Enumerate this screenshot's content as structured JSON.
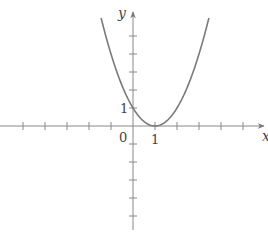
{
  "chart_data": {
    "type": "line",
    "title": "",
    "function": "y = (x - 1)^2",
    "xlabel": "x",
    "ylabel": "y",
    "origin_label": "0",
    "x_tick_labels": [
      {
        "value": 1,
        "label": "1"
      }
    ],
    "y_tick_labels": [
      {
        "value": 1,
        "label": "1"
      }
    ],
    "x_ticks": [
      -5,
      -4,
      -3,
      -2,
      -1,
      1,
      2,
      3,
      4,
      5
    ],
    "y_ticks": [
      -6,
      -5,
      -4,
      -3,
      -2,
      -1,
      1,
      2,
      3,
      4,
      5
    ],
    "xlim": [
      -6,
      6
    ],
    "ylim": [
      -6,
      6
    ],
    "grid": false,
    "legend": null,
    "series": [
      {
        "name": "parabola",
        "x": [
          -1.45,
          -1,
          -0.5,
          0,
          0.5,
          1,
          1.5,
          2,
          2.5,
          3,
          3.45
        ],
        "y": [
          6.0,
          4,
          2.25,
          1,
          0.25,
          0,
          0.25,
          1,
          2.25,
          4,
          6.0
        ]
      }
    ],
    "key_points": [
      {
        "name": "vertex",
        "x": 1,
        "y": 0
      },
      {
        "name": "y-intercept",
        "x": 0,
        "y": 1
      }
    ],
    "colors": {
      "axis": "#777777",
      "curve": "#777777",
      "text": "#444444"
    }
  }
}
